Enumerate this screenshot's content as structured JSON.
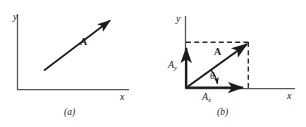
{
  "figure": {
    "background_color": "#ffffff",
    "ink_color": "#3a3a3a",
    "vector_color": "#1c1c1c",
    "width": 306,
    "height": 127
  },
  "panels": [
    {
      "id": "a",
      "caption": "(a)",
      "axes": {
        "y_label": "y",
        "x_label": "x"
      },
      "vector": {
        "label": "A",
        "description": "arrow pointing up and to the right"
      }
    },
    {
      "id": "b",
      "caption": "(b)",
      "axes": {
        "y_label": "y",
        "x_label": "x"
      },
      "vector": {
        "label": "A",
        "description": "resultant arrow from origin to tip"
      },
      "components": {
        "x_component_label": "A",
        "x_component_sub": "x",
        "y_component_label": "A",
        "y_component_sub": "y"
      },
      "angle": {
        "label": "θ"
      },
      "guides": {
        "horizontal_dashed": true,
        "vertical_dashed": true
      }
    }
  ]
}
